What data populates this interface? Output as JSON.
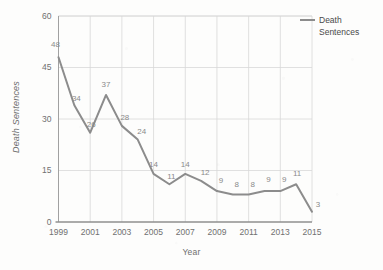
{
  "chart_data": {
    "type": "line",
    "title": "",
    "xlabel": "Year",
    "ylabel": "Death Sentences",
    "xlim": [
      1999,
      2015
    ],
    "ylim": [
      0,
      60
    ],
    "grid": true,
    "legend_position": "top-right",
    "x": [
      1999,
      2000,
      2001,
      2002,
      2003,
      2004,
      2005,
      2006,
      2007,
      2008,
      2009,
      2010,
      2011,
      2012,
      2013,
      2014,
      2015
    ],
    "series": [
      {
        "name": "Death Sentences",
        "color": "#8c8c8c",
        "values": [
          48,
          34,
          26,
          37,
          28,
          24,
          14,
          11,
          14,
          12,
          9,
          8,
          8,
          9,
          9,
          11,
          3
        ]
      }
    ],
    "point_labels": [
      "48",
      "34",
      "26",
      "37",
      "28",
      "24",
      "14",
      "11",
      "14",
      "12",
      "9",
      "8",
      "8",
      "9",
      "9",
      "11",
      "3"
    ],
    "y_ticks": [
      "0",
      "15",
      "30",
      "45",
      "60"
    ],
    "y_tick_values": [
      0,
      15,
      30,
      45,
      60
    ],
    "x_ticks": [
      "1999",
      "2001",
      "2003",
      "2005",
      "2007",
      "2009",
      "2011",
      "2013",
      "2015"
    ],
    "x_tick_values": [
      1999,
      2001,
      2003,
      2005,
      2007,
      2009,
      2011,
      2013,
      2015
    ]
  },
  "legend": {
    "entries": [
      {
        "label": "Death Sentences"
      }
    ]
  },
  "colors": {
    "line": "#8c8c8c",
    "grid": "#d8d8d8",
    "axis": "#9a9a9a",
    "tick_text": "#707070",
    "label_text": "#8a8a8a",
    "background": "#fdfdfc"
  }
}
